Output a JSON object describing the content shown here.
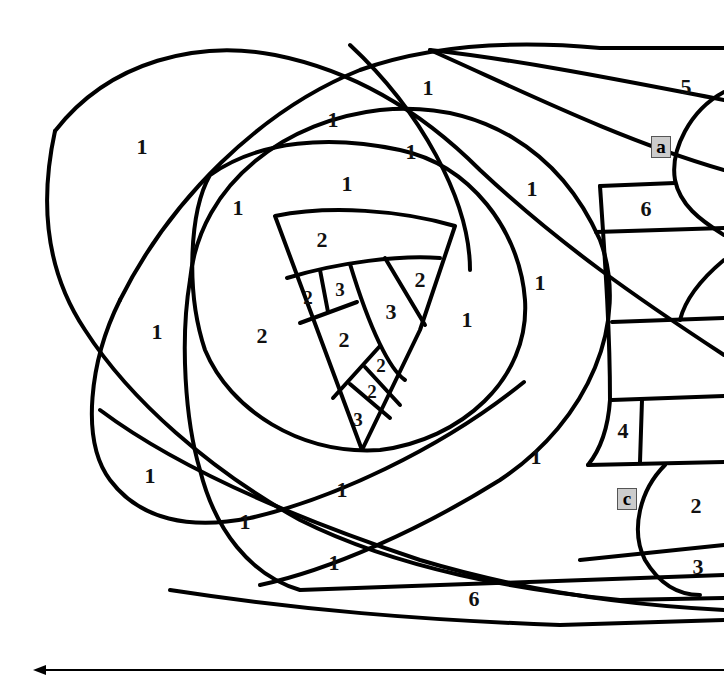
{
  "diagram": {
    "type": "paint-by-number line art",
    "stroke_color": "#000000",
    "background": "#ffffff",
    "tag_fill": "#cccccc",
    "regions": [
      {
        "label": "1",
        "x": 142,
        "y": 147
      },
      {
        "label": "1",
        "x": 333,
        "y": 120
      },
      {
        "label": "1",
        "x": 428,
        "y": 88
      },
      {
        "label": "1",
        "x": 411,
        "y": 152
      },
      {
        "label": "1",
        "x": 347,
        "y": 184
      },
      {
        "label": "1",
        "x": 238,
        "y": 208
      },
      {
        "label": "1",
        "x": 532,
        "y": 189
      },
      {
        "label": "1",
        "x": 540,
        "y": 283
      },
      {
        "label": "1",
        "x": 467,
        "y": 320
      },
      {
        "label": "1",
        "x": 157,
        "y": 332
      },
      {
        "label": "2",
        "x": 262,
        "y": 336
      },
      {
        "label": "1",
        "x": 150,
        "y": 476
      },
      {
        "label": "1",
        "x": 342,
        "y": 490
      },
      {
        "label": "1",
        "x": 536,
        "y": 457
      },
      {
        "label": "1",
        "x": 245,
        "y": 522
      },
      {
        "label": "1",
        "x": 334,
        "y": 563
      },
      {
        "label": "6",
        "x": 474,
        "y": 599
      },
      {
        "label": "5",
        "x": 686,
        "y": 87
      },
      {
        "label": "6",
        "x": 646,
        "y": 209
      },
      {
        "label": "4",
        "x": 623,
        "y": 431
      },
      {
        "label": "2",
        "x": 696,
        "y": 506
      },
      {
        "label": "3",
        "x": 698,
        "y": 567
      },
      {
        "label": "2",
        "x": 322,
        "y": 240
      },
      {
        "label": "2",
        "x": 308,
        "y": 297,
        "small": true
      },
      {
        "label": "3",
        "x": 340,
        "y": 289,
        "small": true
      },
      {
        "label": "3",
        "x": 391,
        "y": 312
      },
      {
        "label": "2",
        "x": 420,
        "y": 280
      },
      {
        "label": "2",
        "x": 344,
        "y": 340
      },
      {
        "label": "2",
        "x": 381,
        "y": 365,
        "small": true
      },
      {
        "label": "2",
        "x": 372,
        "y": 391,
        "small": true
      },
      {
        "label": "3",
        "x": 358,
        "y": 419,
        "small": true
      }
    ],
    "tags": [
      {
        "label": "a",
        "x": 661,
        "y": 147
      },
      {
        "label": "c",
        "x": 627,
        "y": 499
      }
    ],
    "arrow": {
      "direction": "left",
      "y": 670
    }
  }
}
